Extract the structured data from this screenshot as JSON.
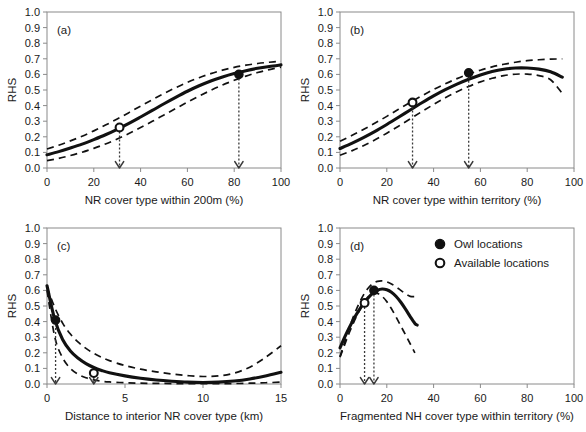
{
  "figure": {
    "ylabel": "RHS",
    "legend": {
      "items": [
        {
          "marker": "filled-circle",
          "label": "Owl locations"
        },
        {
          "marker": "open-circle",
          "label": "Available locations"
        }
      ]
    }
  },
  "chart_data": [
    {
      "type": "line",
      "panel": "(a)",
      "title": "",
      "xlabel": "NR cover type within 200m (%)",
      "ylabel": "RHS",
      "xlim": [
        0,
        100
      ],
      "ylim": [
        0.0,
        1.0
      ],
      "xticks": [
        0,
        20,
        40,
        60,
        80,
        100
      ],
      "yticks": [
        0.0,
        0.1,
        0.2,
        0.3,
        0.4,
        0.5,
        0.6,
        0.7,
        0.8,
        0.9,
        1.0
      ],
      "grid": false,
      "series": [
        {
          "name": "RHS",
          "style": "solid",
          "x": [
            0,
            5,
            10,
            15,
            20,
            25,
            30,
            35,
            40,
            45,
            50,
            55,
            60,
            65,
            70,
            75,
            80,
            85,
            90,
            95,
            100
          ],
          "values": [
            0.085,
            0.105,
            0.128,
            0.153,
            0.182,
            0.213,
            0.248,
            0.286,
            0.327,
            0.369,
            0.412,
            0.453,
            0.492,
            0.527,
            0.558,
            0.584,
            0.606,
            0.624,
            0.639,
            0.651,
            0.661
          ]
        },
        {
          "name": "Upper 95% CI",
          "style": "dashed",
          "x": [
            0,
            5,
            10,
            15,
            20,
            25,
            30,
            35,
            40,
            45,
            50,
            55,
            60,
            65,
            70,
            75,
            80,
            85,
            90,
            95,
            100
          ],
          "values": [
            0.122,
            0.146,
            0.174,
            0.204,
            0.238,
            0.275,
            0.314,
            0.355,
            0.397,
            0.438,
            0.478,
            0.515,
            0.549,
            0.579,
            0.605,
            0.627,
            0.645,
            0.659,
            0.67,
            0.678,
            0.684
          ]
        },
        {
          "name": "Lower 95% CI",
          "style": "dashed",
          "x": [
            0,
            5,
            10,
            15,
            20,
            25,
            30,
            35,
            40,
            45,
            50,
            55,
            60,
            65,
            70,
            75,
            80,
            85,
            90,
            95,
            100
          ],
          "values": [
            0.047,
            0.062,
            0.08,
            0.101,
            0.126,
            0.154,
            0.186,
            0.221,
            0.259,
            0.299,
            0.34,
            0.381,
            0.422,
            0.461,
            0.498,
            0.532,
            0.562,
            0.589,
            0.612,
            0.631,
            0.647
          ]
        }
      ],
      "points": [
        {
          "type": "available",
          "marker": "open-circle",
          "x": 31,
          "y": 0.26
        },
        {
          "type": "owl",
          "marker": "filled-circle",
          "x": 82,
          "y": 0.6
        }
      ],
      "droplines": [
        {
          "x": 31,
          "from_y": 0.26,
          "to_y": 0.0
        },
        {
          "x": 82,
          "from_y": 0.6,
          "to_y": 0.0
        }
      ]
    },
    {
      "type": "line",
      "panel": "(b)",
      "title": "",
      "xlabel": "NR cover type within territory (%)",
      "ylabel": "RHS",
      "xlim": [
        0,
        100
      ],
      "ylim": [
        0.0,
        1.0
      ],
      "xticks": [
        0,
        20,
        40,
        60,
        80,
        100
      ],
      "yticks": [
        0.0,
        0.1,
        0.2,
        0.3,
        0.4,
        0.5,
        0.6,
        0.7,
        0.8,
        0.9,
        1.0
      ],
      "grid": false,
      "series": [
        {
          "name": "RHS",
          "style": "solid",
          "x": [
            0,
            5,
            10,
            15,
            20,
            25,
            30,
            35,
            40,
            45,
            50,
            55,
            60,
            65,
            70,
            75,
            80,
            85,
            90,
            95
          ],
          "values": [
            0.125,
            0.158,
            0.195,
            0.235,
            0.279,
            0.325,
            0.372,
            0.418,
            0.462,
            0.502,
            0.538,
            0.569,
            0.596,
            0.618,
            0.633,
            0.641,
            0.641,
            0.634,
            0.617,
            0.582
          ]
        },
        {
          "name": "Upper 95% CI",
          "style": "dashed",
          "x": [
            0,
            5,
            10,
            15,
            20,
            25,
            30,
            35,
            40,
            45,
            50,
            55,
            60,
            65,
            70,
            75,
            80,
            85,
            90,
            95
          ],
          "values": [
            0.172,
            0.208,
            0.247,
            0.288,
            0.331,
            0.376,
            0.42,
            0.463,
            0.503,
            0.54,
            0.573,
            0.602,
            0.627,
            0.648,
            0.665,
            0.678,
            0.688,
            0.694,
            0.698,
            0.699
          ]
        },
        {
          "name": "Lower 95% CI",
          "style": "dashed",
          "x": [
            0,
            5,
            10,
            15,
            20,
            25,
            30,
            35,
            40,
            45,
            50,
            55,
            60,
            65,
            70,
            75,
            80,
            85,
            90,
            95
          ],
          "values": [
            0.082,
            0.11,
            0.143,
            0.181,
            0.223,
            0.268,
            0.315,
            0.362,
            0.407,
            0.45,
            0.489,
            0.523,
            0.552,
            0.575,
            0.592,
            0.601,
            0.602,
            0.592,
            0.566,
            0.478
          ]
        }
      ],
      "points": [
        {
          "type": "available",
          "marker": "open-circle",
          "x": 31,
          "y": 0.42
        },
        {
          "type": "owl",
          "marker": "filled-circle",
          "x": 55,
          "y": 0.61
        }
      ],
      "droplines": [
        {
          "x": 31,
          "from_y": 0.42,
          "to_y": 0.0
        },
        {
          "x": 55,
          "from_y": 0.61,
          "to_y": 0.0
        }
      ]
    },
    {
      "type": "line",
      "panel": "(c)",
      "title": "",
      "xlabel": "Distance to interior NR cover type (km)",
      "ylabel": "RHS",
      "xlim": [
        0,
        15
      ],
      "ylim": [
        0.0,
        1.0
      ],
      "xticks": [
        0,
        5,
        10,
        15
      ],
      "yticks": [
        0.0,
        0.1,
        0.2,
        0.3,
        0.4,
        0.5,
        0.6,
        0.7,
        0.8,
        0.9,
        1.0
      ],
      "grid": false,
      "series": [
        {
          "name": "RHS",
          "style": "solid",
          "x": [
            0,
            0.5,
            1,
            1.5,
            2,
            2.5,
            3,
            3.5,
            4,
            5,
            6,
            7,
            8,
            9,
            10,
            11,
            12,
            13,
            14,
            15
          ],
          "values": [
            0.63,
            0.412,
            0.285,
            0.212,
            0.165,
            0.131,
            0.106,
            0.087,
            0.072,
            0.052,
            0.037,
            0.026,
            0.018,
            0.012,
            0.01,
            0.012,
            0.019,
            0.032,
            0.051,
            0.075
          ]
        },
        {
          "name": "Upper 95% CI",
          "style": "dashed",
          "x": [
            0,
            0.5,
            1,
            1.5,
            2,
            2.5,
            3,
            3.5,
            4,
            5,
            6,
            7,
            8,
            9,
            10,
            11,
            12,
            13,
            14,
            15
          ],
          "values": [
            0.62,
            0.49,
            0.39,
            0.32,
            0.268,
            0.228,
            0.196,
            0.171,
            0.15,
            0.118,
            0.095,
            0.078,
            0.064,
            0.054,
            0.048,
            0.052,
            0.07,
            0.108,
            0.17,
            0.245
          ]
        },
        {
          "name": "Lower 95% CI",
          "style": "dashed",
          "x": [
            0,
            0.5,
            1,
            1.5,
            2,
            2.5,
            3,
            3.5,
            4,
            5,
            6,
            7,
            8,
            9,
            10,
            11,
            12,
            13,
            14,
            15
          ],
          "values": [
            0.6,
            0.3,
            0.168,
            0.1,
            0.062,
            0.04,
            0.026,
            0.018,
            0.013,
            0.008,
            0.005,
            0.004,
            0.003,
            0.002,
            0.002,
            0.002,
            0.003,
            0.005,
            0.008,
            0.012
          ]
        }
      ],
      "points": [
        {
          "type": "owl",
          "marker": "filled-circle",
          "x": 0.55,
          "y": 0.41
        },
        {
          "type": "available",
          "marker": "open-circle",
          "x": 3.0,
          "y": 0.07
        }
      ],
      "droplines": [
        {
          "x": 0.55,
          "from_y": 0.41,
          "to_y": 0.0
        },
        {
          "x": 3.0,
          "from_y": 0.07,
          "to_y": 0.0
        }
      ]
    },
    {
      "type": "line",
      "panel": "(d)",
      "title": "",
      "xlabel": "Fragmented NH cover type within territory (%)",
      "ylabel": "RHS",
      "xlim": [
        0,
        100
      ],
      "ylim": [
        0.0,
        1.0
      ],
      "xticks": [
        0,
        20,
        40,
        60,
        80,
        100
      ],
      "yticks": [
        0.0,
        0.1,
        0.2,
        0.3,
        0.4,
        0.5,
        0.6,
        0.7,
        0.8,
        0.9,
        1.0
      ],
      "grid": false,
      "series": [
        {
          "name": "RHS",
          "style": "solid",
          "x": [
            0,
            2,
            4,
            6,
            8,
            10,
            12,
            14,
            16,
            18,
            20,
            22,
            24,
            26,
            28,
            30,
            32,
            33
          ],
          "values": [
            0.232,
            0.3,
            0.362,
            0.42,
            0.47,
            0.515,
            0.552,
            0.582,
            0.601,
            0.609,
            0.604,
            0.588,
            0.561,
            0.524,
            0.48,
            0.432,
            0.388,
            0.378
          ]
        },
        {
          "name": "Upper 95% CI",
          "style": "dashed",
          "x": [
            0,
            2,
            4,
            6,
            8,
            10,
            12,
            14,
            16,
            18,
            20,
            22,
            24,
            26,
            28,
            30,
            32
          ],
          "values": [
            0.175,
            0.268,
            0.36,
            0.442,
            0.512,
            0.57,
            0.614,
            0.643,
            0.658,
            0.661,
            0.655,
            0.641,
            0.622,
            0.6,
            0.578,
            0.562,
            0.56
          ]
        },
        {
          "name": "Lower 95% CI",
          "style": "dashed",
          "x": [
            0,
            2,
            4,
            6,
            8,
            10,
            12,
            14,
            16,
            18,
            20,
            22,
            24,
            26,
            28,
            30,
            32
          ],
          "values": [
            0.172,
            0.252,
            0.33,
            0.4,
            0.462,
            0.516,
            0.556,
            0.578,
            0.58,
            0.562,
            0.528,
            0.482,
            0.428,
            0.372,
            0.315,
            0.258,
            0.2
          ]
        }
      ],
      "points": [
        {
          "type": "available",
          "marker": "open-circle",
          "x": 10.5,
          "y": 0.52
        },
        {
          "type": "owl",
          "marker": "filled-circle",
          "x": 14.5,
          "y": 0.6
        }
      ],
      "droplines": [
        {
          "x": 10.5,
          "from_y": 0.52,
          "to_y": 0.0
        },
        {
          "x": 14.5,
          "from_y": 0.6,
          "to_y": 0.0
        }
      ]
    }
  ]
}
